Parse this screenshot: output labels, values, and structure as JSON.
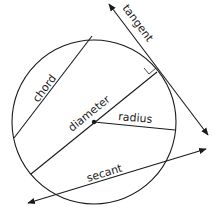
{
  "diagram": {
    "stroke_color": "#1a1a1a",
    "circle": {
      "cx": 94,
      "cy": 122,
      "r": 82
    },
    "labels": {
      "tangent": "tangent",
      "chord": "chord",
      "diameter": "diameter",
      "radius": "radius",
      "secant": "secant"
    }
  }
}
